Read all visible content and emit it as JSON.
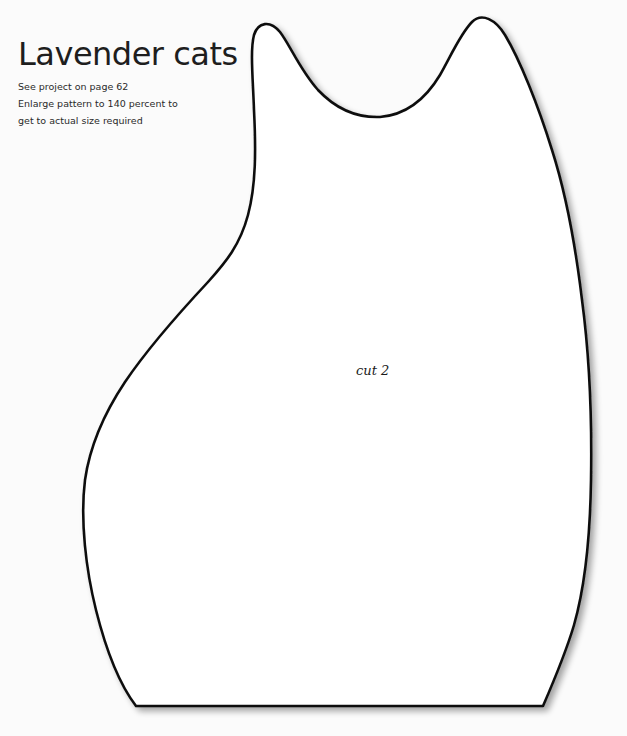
{
  "header": {
    "title": "Lavender cats",
    "lines": [
      "See project on page 62",
      "Enlarge pattern to 140 percent to",
      "get to actual size required"
    ]
  },
  "pattern": {
    "shape": "cat-silhouette",
    "label": "cut 2",
    "fill_color": "#ffffff",
    "outline_color": "#111111"
  }
}
